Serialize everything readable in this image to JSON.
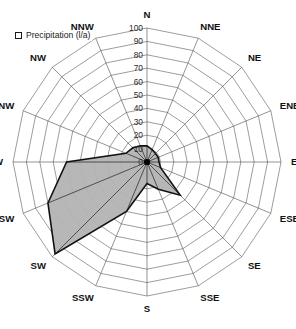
{
  "legend": {
    "swatch_name": "series-color-swatch",
    "label": "Precipitation (l/a)",
    "swatch_fill": "#ffffff",
    "swatch_border": "#1a1a1a"
  },
  "caption": {
    "text": ""
  },
  "colors": {
    "series_fill": "#b3b3b3",
    "series_stroke": "#111111",
    "grid": "#4c4c4c",
    "text": "#111111",
    "background": "#ffffff"
  },
  "chart_data": {
    "type": "radar",
    "title": "",
    "subtitle": "",
    "xlabel": "",
    "ylabel": "",
    "grid": true,
    "legend_position": "top-left",
    "radial_axis": {
      "min": 0,
      "max": 100,
      "step": 10,
      "unit": "l/a",
      "tick_labels": [
        "0",
        "10",
        "20",
        "30",
        "40",
        "50",
        "60",
        "70",
        "80",
        "90",
        "100"
      ],
      "tick_values": [
        0,
        10,
        20,
        30,
        40,
        50,
        60,
        70,
        80,
        90,
        100
      ],
      "label_axis": "N"
    },
    "categories": [
      "N",
      "NNE",
      "NE",
      "ENE",
      "ENE",
      "ESE",
      "SE",
      "SSE",
      "S",
      "SSW",
      "SW",
      "WSW",
      "W",
      "WNW",
      "NW",
      "NNW"
    ],
    "category_angles_deg": [
      0,
      22.5,
      45,
      67.5,
      90,
      112.5,
      135,
      157.5,
      180,
      202.5,
      225,
      247.5,
      270,
      292.5,
      315,
      337.5
    ],
    "series": [
      {
        "name": "Precipitation (l/a)",
        "values": [
          12,
          10,
          9,
          9,
          9,
          11,
          35,
          22,
          16,
          40,
          97,
          80,
          60,
          17,
          15,
          13
        ]
      }
    ]
  }
}
